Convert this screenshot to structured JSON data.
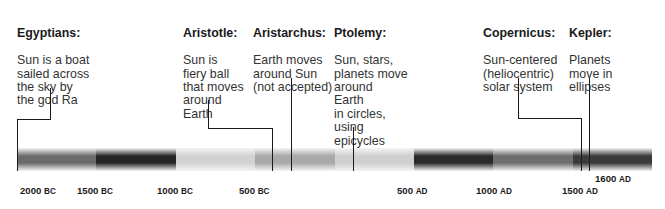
{
  "diagram": {
    "type": "timeline"
  },
  "events": [
    {
      "id": "egyptians",
      "title": "Egyptians:",
      "body": "Sun is a boat\nsailed across\nthe sky by\nthe god Ra"
    },
    {
      "id": "aristotle",
      "title": "Aristotle:",
      "body": "Sun is\nfiery ball\nthat moves\naround\nEarth"
    },
    {
      "id": "aristarchus",
      "title": "Aristarchus:",
      "body": "Earth moves\naround Sun\n(not accepted)"
    },
    {
      "id": "ptolemy",
      "title": "Ptolemy:",
      "body": "Sun, stars,\nplanets move\naround\nEarth\nin circles,\nusing\nepicycles"
    },
    {
      "id": "copernicus",
      "title": "Copernicus:",
      "body": "Sun-centered\n(heliocentric)\nsolar system"
    },
    {
      "id": "kepler",
      "title": "Kepler:",
      "body": "Planets\nmove in\nellipses"
    }
  ],
  "axis": {
    "ticks": [
      {
        "year": "2000",
        "era": "BC"
      },
      {
        "year": "1500",
        "era": "BC"
      },
      {
        "year": "1000",
        "era": "BC"
      },
      {
        "year": "500",
        "era": "BC"
      },
      {
        "year": "500",
        "era": "AD"
      },
      {
        "year": "1000",
        "era": "AD"
      },
      {
        "year": "1500",
        "era": "AD"
      },
      {
        "year": "1600",
        "era": "AD"
      }
    ]
  },
  "bar": {
    "segments": [
      "#6b6b6b",
      "#262626",
      "#d2d2d2",
      "#a9a9a9",
      "#cfcfcf",
      "#2a2a2a",
      "#6e6e6e",
      "#3a3a3a"
    ]
  },
  "colors": {
    "line": "#1a1a1a",
    "text": "#333333",
    "background": "#ffffff"
  }
}
